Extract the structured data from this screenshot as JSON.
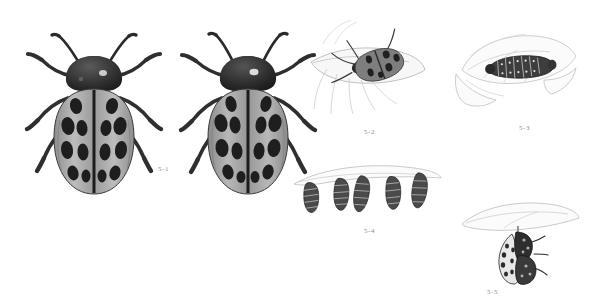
{
  "plate": {
    "title": "Spotted leaf beetle life-cycle plate",
    "background_color": "#ffffff",
    "ink_color": "#2b2b2b",
    "label_color": "#8d8d8d",
    "width": 609,
    "height": 306
  },
  "figures": [
    {
      "label": "5-1",
      "name": "adult-beetles-dorsal",
      "subject": "adult spotted leaf beetles, dorsal view, pair",
      "count": 2,
      "label_x": 158,
      "label_y": 165
    },
    {
      "label": "5-2",
      "name": "adult-beetle-on-leaf",
      "subject": "adult beetle resting on a leaf",
      "count": 1,
      "label_x": 364,
      "label_y": 128
    },
    {
      "label": "5-3",
      "name": "larva-on-leaf",
      "subject": "larva feeding on a leaf",
      "count": 1,
      "label_x": 519,
      "label_y": 124
    },
    {
      "label": "5-4",
      "name": "pupae-row-on-leaf-edge",
      "subject": "row of pupae suspended from a leaf edge",
      "count": 5,
      "label_x": 364,
      "label_y": 227
    },
    {
      "label": "5-5",
      "name": "pupa-with-emerging-adult",
      "subject": "pupa with emerging adult hanging beneath a leaf",
      "count": 1,
      "label_x": 487,
      "label_y": 288
    }
  ],
  "beetle_5_1": {
    "left_spot_rows": [
      2,
      2,
      2,
      2,
      2,
      2
    ],
    "right_spot_rows": [
      2,
      2,
      2,
      2,
      2,
      2
    ],
    "elytra_fill": "#a9a9a9",
    "spot_fill": "#242424",
    "pronotum_fill": "#2e2e2e"
  }
}
